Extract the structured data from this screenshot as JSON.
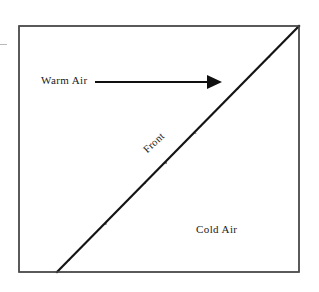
{
  "diagram": {
    "frame": {
      "x": 19,
      "y": 26,
      "width": 280,
      "height": 246,
      "stroke_color": "#4a4a4a",
      "stroke_width": 1.4
    },
    "front_line": {
      "name": "front-boundary-line",
      "x1": 57,
      "y1": 272,
      "x2": 299,
      "y2": 26,
      "stroke_color": "#141414",
      "stroke_width": 2.2
    },
    "cold_air_region": {
      "name": "cold-air-wedge",
      "fill_color": "#ffffff",
      "stipple_color": "#555555",
      "stipple_count": 620,
      "stipple_dash_length_px": 6,
      "description": "lower-right triangular wedge filled with randomly oriented short dashes"
    },
    "warm_air_region": {
      "name": "warm-air-region",
      "fill_color": "#ffffff",
      "description": "upper-left triangular region, unshaded"
    },
    "arrow": {
      "name": "warm-air-flow-arrow",
      "label": "warm-air-direction",
      "x1": 95,
      "y1": 82,
      "x2": 222,
      "y2": 82,
      "color": "#101010",
      "shaft_width": 2,
      "head_length": 15,
      "head_width": 14,
      "direction": "right"
    },
    "labels": {
      "warm_air": "Warm Air",
      "cold_air": "Cold Air",
      "front": "Front"
    },
    "colors": {
      "ink": "#1a1a1a",
      "frame": "#4a4a4a",
      "stipple": "#555555",
      "background": "#ffffff"
    }
  }
}
